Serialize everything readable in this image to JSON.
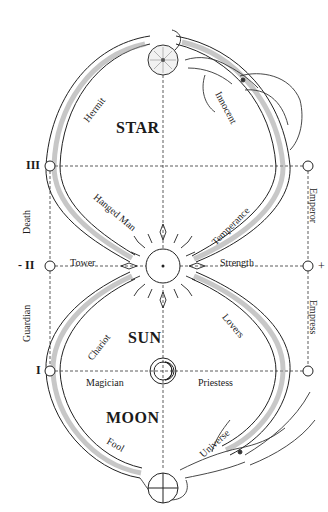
{
  "diagram": {
    "regions": {
      "upper": "STAR",
      "middle": "SUN",
      "lower": "MOON"
    },
    "upper_loop_cards": {
      "hermit": "Hermit",
      "innocent": "Innocent",
      "hanged_man": "Hanged Man",
      "temperance": "Temperance"
    },
    "middle_row": {
      "tower": "Tower",
      "strength": "Strength"
    },
    "lower_loop_cards": {
      "chariot": "Chariot",
      "lovers": "Lovers",
      "magician": "Magician",
      "priestess": "Priestess",
      "fool": "Fool",
      "universe": "Universe"
    },
    "left_side": {
      "level_3": "III",
      "level_2": "- II",
      "level_1": "I",
      "upper_label": "Death",
      "lower_label": "Guardian"
    },
    "right_side": {
      "plus": "+",
      "upper_label": "Emperor",
      "lower_label": "Empress"
    },
    "symbols": {
      "top": "star-disc",
      "center": "sun",
      "lower_center": "moon",
      "bottom": "earth-cross-circle"
    },
    "colors": {
      "ink": "#1a1a1a",
      "shade": "#9a9a9a",
      "background": "#ffffff"
    }
  }
}
